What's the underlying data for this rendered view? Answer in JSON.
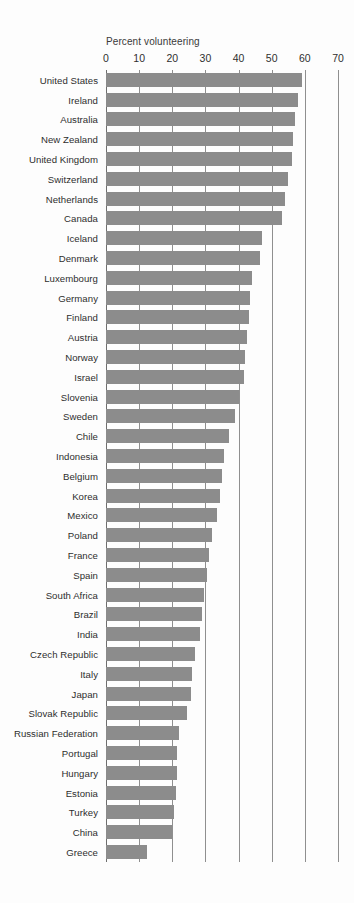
{
  "chart_data": {
    "type": "bar",
    "orientation": "horizontal",
    "title": "",
    "xlabel": "Percent volunteering",
    "ylabel": "",
    "xlim": [
      0,
      70
    ],
    "xticks": [
      0,
      10,
      20,
      30,
      40,
      50,
      60,
      70
    ],
    "grid": true,
    "legend": false,
    "bar_color": "#8c8c8c",
    "background_color": "#fdfdfd",
    "axis_color": "#8f8f8f",
    "text_color": "#2e2e2e",
    "categories": [
      "United States",
      "Ireland",
      "Australia",
      "New Zealand",
      "United Kingdom",
      "Switzerland",
      "Netherlands",
      "Canada",
      "Iceland",
      "Denmark",
      "Luxembourg",
      "Germany",
      "Finland",
      "Austria",
      "Norway",
      "Israel",
      "Slovenia",
      "Sweden",
      "Chile",
      "Indonesia",
      "Belgium",
      "Korea",
      "Mexico",
      "Poland",
      "France",
      "Spain",
      "South Africa",
      "Brazil",
      "India",
      "Czech Republic",
      "Italy",
      "Japan",
      "Slovak Republic",
      "Russian Federation",
      "Portugal",
      "Hungary",
      "Estonia",
      "Turkey",
      "China",
      "Greece"
    ],
    "values": [
      59,
      58,
      57,
      56.5,
      56,
      55,
      54,
      53,
      47,
      46.5,
      44,
      43.5,
      43,
      42.5,
      42,
      41.5,
      40,
      39,
      37,
      35.5,
      35,
      34.5,
      33.5,
      32,
      31,
      30.5,
      29.5,
      29,
      28.5,
      27,
      26,
      25.5,
      24.5,
      22,
      21.5,
      21.5,
      21,
      20.5,
      20,
      12.5
    ]
  }
}
